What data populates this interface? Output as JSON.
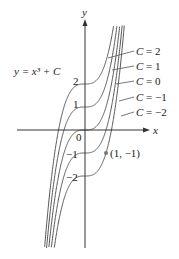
{
  "figure": {
    "equation_label": "y = x³ + C",
    "axis_x_label": "x",
    "axis_y_label": "y",
    "origin_label": "0",
    "y_tick_labels": [
      "2",
      "1",
      "−1",
      "−2"
    ],
    "curve_labels": [
      "C = 2",
      "C = 1",
      "C = 0",
      "C = −1",
      "C = −2"
    ],
    "point_label": "(1, −1)",
    "colors": {
      "curve": "#555555",
      "axis": "#333333",
      "point": "#777777"
    }
  },
  "chart_data": {
    "type": "line",
    "xlabel": "x",
    "ylabel": "y",
    "series": [
      {
        "name": "C = 2",
        "C": 2
      },
      {
        "name": "C = 1",
        "C": 1
      },
      {
        "name": "C = 0",
        "C": 0
      },
      {
        "name": "C = -1",
        "C": -1
      },
      {
        "name": "C = -2",
        "C": -2
      }
    ],
    "y_ticks": [
      2,
      1,
      -1,
      -2
    ],
    "highlighted_point": {
      "x": 1,
      "y": -1,
      "label": "(1, -1)"
    }
  }
}
